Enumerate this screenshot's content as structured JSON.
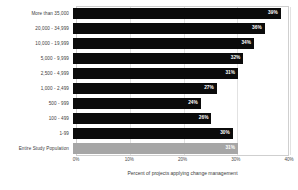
{
  "chart_data": {
    "type": "bar",
    "orientation": "horizontal",
    "title": "",
    "xlabel": "Percent of projects applying change management",
    "ylabel": "",
    "xlim": [
      0,
      40
    ],
    "xtick_labels": [
      "0%",
      "10%",
      "20%",
      "30%",
      "40%"
    ],
    "xticks": [
      0,
      10,
      20,
      30,
      40
    ],
    "grid": true,
    "legend": "none",
    "categories": [
      "More than 35,000",
      "20,000 - 34,999",
      "10,000 - 19,999",
      "5,000 - 9,999",
      "2,500 - 4,999",
      "1,000 - 2,499",
      "500 - 999",
      "100 - 499",
      "1-99",
      "Entire Study Population"
    ],
    "values": [
      39,
      36,
      34,
      32,
      31,
      27,
      24,
      26,
      30,
      31
    ],
    "value_labels": [
      "39%",
      "36%",
      "34%",
      "32%",
      "31%",
      "27%",
      "24%",
      "26%",
      "30%",
      "31%"
    ],
    "bar_colors": [
      "#0b0b0b",
      "#0b0b0b",
      "#0b0b0b",
      "#0b0b0b",
      "#0b0b0b",
      "#0b0b0b",
      "#0b0b0b",
      "#0b0b0b",
      "#0b0b0b",
      "#a6a6a6"
    ],
    "summary_index": 9
  }
}
